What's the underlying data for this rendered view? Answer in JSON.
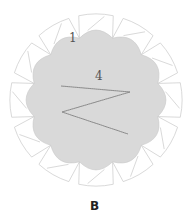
{
  "diagram": {
    "panel_label": "B",
    "labels": {
      "outer_segment": "1",
      "inner_region": "4"
    },
    "geometry": {
      "center": [
        96,
        100
      ],
      "segments": 12,
      "outer_radius": 86,
      "inner_radius": 64
    },
    "colors": {
      "inner_fill": "#d9d9d9",
      "segment_fill": "#ffffff",
      "stroke": "#c8c8c8",
      "wave": "#8a8a8a",
      "text": "#555555",
      "panel_label": "#222222"
    }
  }
}
